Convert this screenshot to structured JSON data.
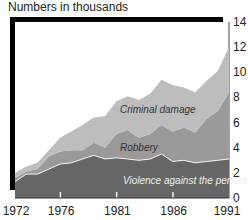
{
  "chart_data": {
    "type": "area",
    "stacked": true,
    "title": "",
    "ylabel": "Numbers in thousands",
    "xlabel": "",
    "x": [
      1972,
      1973,
      1974,
      1975,
      1976,
      1977,
      1978,
      1979,
      1980,
      1981,
      1982,
      1983,
      1984,
      1985,
      1986,
      1987,
      1988,
      1989,
      1990,
      1991
    ],
    "xticks": [
      "1972",
      "1976",
      "1981",
      "1986",
      "1991"
    ],
    "yticks": [
      "0",
      "2",
      "4",
      "6",
      "8",
      "10",
      "12",
      "14"
    ],
    "ylim": [
      0,
      14
    ],
    "grid": false,
    "legend": "inline labels",
    "series": [
      {
        "name": "Violence against the person",
        "color": "#666666",
        "values": [
          1.3,
          1.9,
          1.9,
          2.3,
          2.7,
          2.8,
          3.1,
          3.4,
          3.1,
          3.2,
          3.1,
          3.0,
          3.1,
          3.5,
          2.9,
          3.0,
          2.8,
          2.9,
          3.0,
          3.1
        ]
      },
      {
        "name": "Robbery",
        "color": "#9a9a9a",
        "values": [
          0.3,
          0.2,
          0.4,
          1.0,
          1.0,
          1.0,
          0.7,
          1.0,
          0.9,
          1.9,
          2.3,
          1.8,
          2.0,
          2.3,
          2.4,
          2.6,
          2.4,
          3.4,
          3.9,
          5.3
        ]
      },
      {
        "name": "Criminal damage",
        "color": "#bdbdbd",
        "values": [
          0.4,
          0.4,
          0.5,
          0.5,
          1.1,
          1.5,
          2.0,
          2.0,
          2.5,
          2.6,
          2.7,
          3.0,
          3.2,
          3.6,
          3.7,
          3.2,
          3.2,
          3.0,
          3.2,
          3.6
        ]
      }
    ]
  },
  "labels": {
    "y_title": "Numbers in thousands",
    "violence": "Violence against the person",
    "robbery": "Robbery",
    "damage": "Criminal damage"
  }
}
